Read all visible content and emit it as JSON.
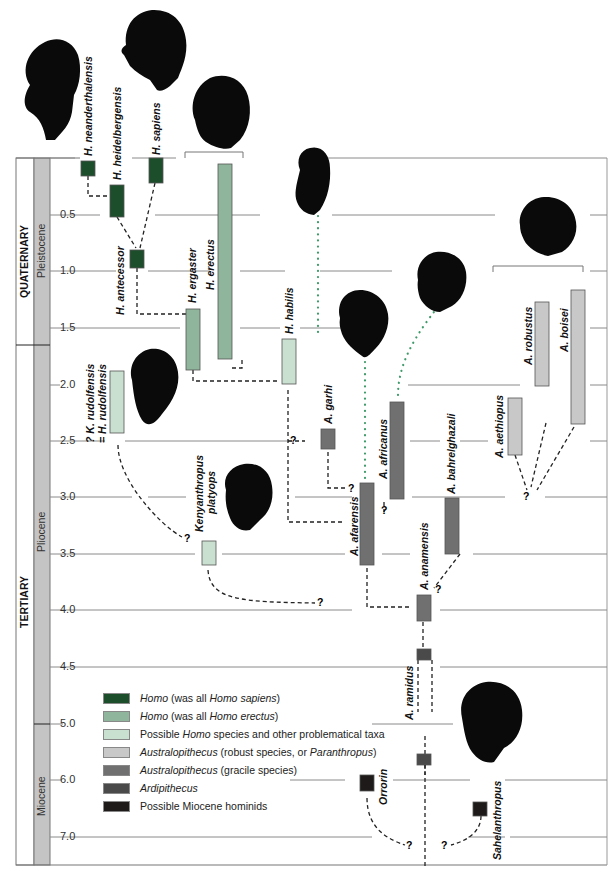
{
  "chart_data": {
    "type": "phylogeny-timeline",
    "title": "",
    "ylabel": "Millions of years ago",
    "y_ticks": [
      "0.5",
      "1.0",
      "1.5",
      "2.0",
      "2.5",
      "3.0",
      "3.5",
      "4.0",
      "4.5",
      "5.0",
      "6.0",
      "7.0"
    ],
    "periods": [
      {
        "name": "QUATERNARY",
        "from": 0.0,
        "to": 1.8
      },
      {
        "name": "TERTIARY",
        "from": 1.8,
        "to": 7.5
      }
    ],
    "epochs": [
      {
        "name": "Pleistocene",
        "from": 0.0,
        "to": 1.8
      },
      {
        "name": "Pliocene",
        "from": 1.8,
        "to": 5.0
      },
      {
        "name": "Miocene",
        "from": 5.0,
        "to": 7.5
      }
    ],
    "taxa": [
      {
        "name": "H. neanderthalensis",
        "group": "homo_sapiens",
        "from": 0.03,
        "to": 0.2
      },
      {
        "name": "H. heidelbergensis",
        "group": "homo_sapiens",
        "from": 0.25,
        "to": 0.6
      },
      {
        "name": "H. sapiens",
        "group": "homo_sapiens",
        "from": 0.0,
        "to": 0.2
      },
      {
        "name": "H. antecessor",
        "group": "homo_sapiens",
        "from": 0.78,
        "to": 0.95
      },
      {
        "name": "H. erectus",
        "group": "homo_erectus",
        "from": 0.05,
        "to": 1.8
      },
      {
        "name": "H. ergaster",
        "group": "homo_erectus",
        "from": 1.3,
        "to": 1.85
      },
      {
        "name": "H. habilis",
        "group": "possible_homo",
        "from": 1.6,
        "to": 2.0
      },
      {
        "name": "? K. rudolfensis = H. rudolfensis",
        "group": "possible_homo",
        "from": 1.9,
        "to": 2.4
      },
      {
        "name": "Kenyanthropus platyops",
        "group": "possible_homo",
        "from": 3.4,
        "to": 3.6
      },
      {
        "name": "A. garhi",
        "group": "gracile",
        "from": 2.45,
        "to": 2.6
      },
      {
        "name": "A. afarensis",
        "group": "gracile",
        "from": 2.9,
        "to": 3.6
      },
      {
        "name": "A. africanus",
        "group": "gracile",
        "from": 2.15,
        "to": 3.0
      },
      {
        "name": "A. bahrelghazali",
        "group": "gracile",
        "from": 3.0,
        "to": 3.5
      },
      {
        "name": "A. anamensis",
        "group": "gracile",
        "from": 3.85,
        "to": 4.1
      },
      {
        "name": "A. ramidus",
        "group": "ardipithecus",
        "from": 4.32,
        "to": 5.75
      },
      {
        "name": "A. aethiopus",
        "group": "robust",
        "from": 2.1,
        "to": 2.6
      },
      {
        "name": "A. robustus",
        "group": "robust",
        "from": 1.25,
        "to": 2.0
      },
      {
        "name": "A. boisei",
        "group": "robust",
        "from": 1.15,
        "to": 2.35
      },
      {
        "name": "Orrorin",
        "group": "miocene",
        "from": 5.95,
        "to": 6.1
      },
      {
        "name": "Sahelanthropus",
        "group": "miocene",
        "from": 6.5,
        "to": 6.7
      }
    ]
  },
  "axis": {
    "ticks": [
      "0.5",
      "1.0",
      "1.5",
      "2.0",
      "2.5",
      "3.0",
      "3.5",
      "4.0",
      "4.5",
      "5.0",
      "6.0",
      "7.0"
    ],
    "periods": [
      "QUATERNARY",
      "TERTIARY"
    ],
    "epochs": [
      "Pleistocene",
      "Pliocene",
      "Miocene"
    ]
  },
  "labels": {
    "neanderthalensis": "H. neanderthalensis",
    "heidelbergensis": "H. heidelbergensis",
    "sapiens": "H. sapiens",
    "antecessor": "H. antecessor",
    "ergaster": "H. ergaster",
    "erectus": "H. erectus",
    "habilis": "H. habilis",
    "rudolfensis1": "? K. rudolfensis",
    "rudolfensis2": "= H. rudolfensis",
    "kenyanthropus1": "Kenyanthropus",
    "kenyanthropus2": "platyops",
    "garhi": "A. garhi",
    "afarensis": "A. afarensis",
    "africanus": "A. africanus",
    "bahrelghazali": "A. bahrelghazali",
    "anamensis": "A. anamensis",
    "ramidus": "A. ramidus",
    "aethiopus": "A. aethiopus",
    "robustus": "A. robustus",
    "boisei": "A. boisei",
    "orrorin": "Orrorin",
    "sahelanthropus": "Sahelanthropus",
    "q": "?"
  },
  "legend": [
    {
      "key": "homo_sapiens",
      "color": "#1d4e2c",
      "parts": [
        {
          "t": "Homo",
          "i": true
        },
        {
          "t": " (was all ",
          "i": false
        },
        {
          "t": "Homo sapiens",
          "i": true
        },
        {
          "t": ")",
          "i": false
        }
      ]
    },
    {
      "key": "homo_erectus",
      "color": "#8fb59c",
      "parts": [
        {
          "t": "Homo",
          "i": true
        },
        {
          "t": " (was all ",
          "i": false
        },
        {
          "t": "Homo erectus",
          "i": true
        },
        {
          "t": ")",
          "i": false
        }
      ]
    },
    {
      "key": "possible_homo",
      "color": "#c9dfcf",
      "parts": [
        {
          "t": "Possible ",
          "i": false
        },
        {
          "t": "Homo",
          "i": true
        },
        {
          "t": " species and other problematical taxa",
          "i": false
        }
      ]
    },
    {
      "key": "robust",
      "color": "#c8c8c8",
      "parts": [
        {
          "t": "Australopithecus",
          "i": true
        },
        {
          "t": " (robust species, or ",
          "i": false
        },
        {
          "t": "Paranthropus",
          "i": true
        },
        {
          "t": ")",
          "i": false
        }
      ]
    },
    {
      "key": "gracile",
      "color": "#707070",
      "parts": [
        {
          "t": "Australopithecus",
          "i": true
        },
        {
          "t": " (gracile species)",
          "i": false
        }
      ]
    },
    {
      "key": "ardipithecus",
      "color": "#4a4a4a",
      "parts": [
        {
          "t": "Ardipithecus",
          "i": true
        }
      ]
    },
    {
      "key": "miocene",
      "color": "#1e1a1a",
      "parts": [
        {
          "t": "Possible Miocene hominids",
          "i": false
        }
      ]
    }
  ],
  "colors": {
    "homo_sapiens": "#1d4e2c",
    "homo_erectus": "#8fb59c",
    "possible_homo": "#c9dfcf",
    "robust": "#c8c8c8",
    "gracile": "#707070",
    "ardipithecus": "#4a4a4a",
    "miocene": "#1e1a1a",
    "dotted_link": "#3f9a6a",
    "gridline": "#888888",
    "epoch_band": "#c4c4c4"
  }
}
